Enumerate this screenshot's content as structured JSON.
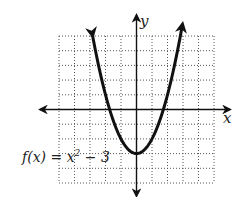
{
  "chart_data": {
    "type": "line",
    "title": "",
    "function_label": "f(x) = x² − 3",
    "label_parts": {
      "prefix": "f(x) = x",
      "exponent": "2",
      "suffix": " − 3"
    },
    "xlabel": "x",
    "ylabel": "y",
    "xlim": [
      -5,
      5
    ],
    "ylim": [
      -5,
      5
    ],
    "grid": true,
    "grid_style": "dotted",
    "series": [
      {
        "name": "f(x) = x^2 - 3",
        "equation": "x^2 - 3",
        "x": [
          -2.85,
          -2.5,
          -2,
          -1.5,
          -1,
          -0.5,
          0,
          0.5,
          1,
          1.5,
          2,
          2.5,
          2.95
        ],
        "y": [
          5.12,
          3.25,
          1,
          -0.75,
          -2,
          -2.75,
          -3,
          -2.75,
          -2,
          -0.75,
          1,
          3.25,
          5.7
        ],
        "arrows": "both-ends"
      }
    ],
    "key_points": {
      "vertex": [
        0,
        -3
      ],
      "x_intercepts": [
        -1.73,
        1.73
      ]
    },
    "colors": {
      "curve": "#111111",
      "axis": "#111111",
      "grid": "#555555"
    }
  }
}
